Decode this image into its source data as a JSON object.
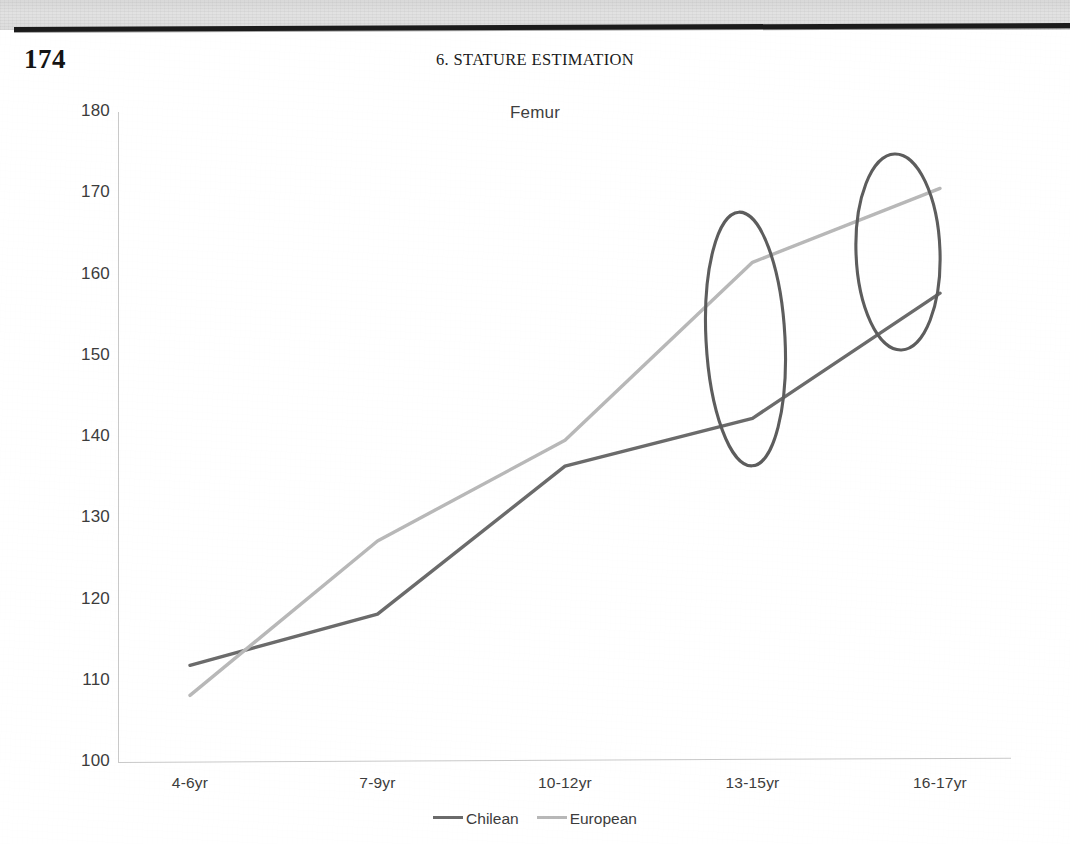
{
  "page": {
    "folio": "174",
    "running_head": "6.  STATURE ESTIMATION"
  },
  "chart_data": {
    "type": "line",
    "title": "Femur",
    "xlabel": "",
    "ylabel": "",
    "categories": [
      "4-6yr",
      "7-9yr",
      "10-12yr",
      "13-15yr",
      "16-17yr"
    ],
    "series": [
      {
        "name": "Chilean",
        "color": "#6b6b6b",
        "values": [
          111.9,
          118.2,
          136.4,
          142.3,
          157.7
        ]
      },
      {
        "name": "European",
        "color": "#b8b8b8",
        "values": [
          108.2,
          127.2,
          139.6,
          161.5,
          170.6
        ]
      }
    ],
    "ylim": [
      100,
      180
    ],
    "yticks": [
      "180",
      "170",
      "160",
      "150",
      "140",
      "130",
      "120",
      "110",
      "100"
    ],
    "grid": false,
    "legend_position": "bottom",
    "annotations": [
      {
        "kind": "ellipse",
        "label": "highlight-ellipse-13-15yr",
        "note": "hand-drawn ellipse around the 13-15yr data points"
      },
      {
        "kind": "ellipse",
        "label": "highlight-ellipse-16-17yr",
        "note": "hand-drawn ellipse around the 16-17yr data points"
      }
    ]
  },
  "legend": {
    "entries": [
      {
        "label": "Chilean",
        "color": "#6b6b6b"
      },
      {
        "label": "European",
        "color": "#b8b8b8"
      }
    ]
  }
}
